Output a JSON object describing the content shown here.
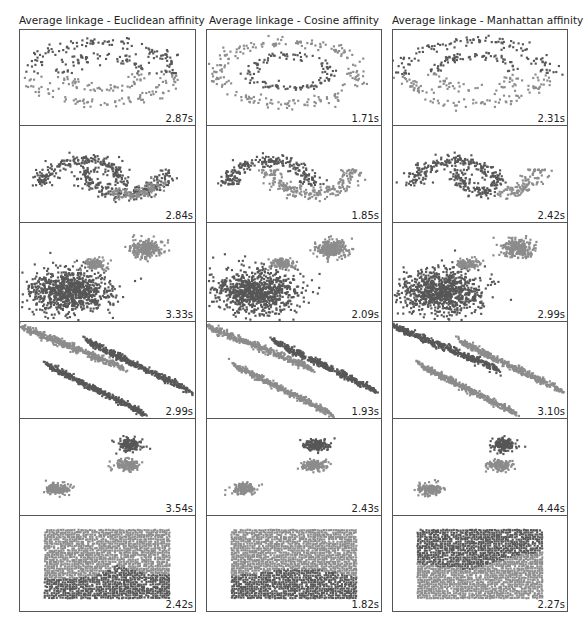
{
  "figure": {
    "background": "#ffffff",
    "cluster_colors": [
      "#575757",
      "#8c8c8c"
    ]
  },
  "columns": [
    {
      "title": "Average linkage - Euclidean affinity"
    },
    {
      "title": "Average linkage - Cosine affinity"
    },
    {
      "title": "Average linkage - Manhattan affinity"
    }
  ],
  "rows": [
    {
      "dataset": "noisy_circles"
    },
    {
      "dataset": "noisy_moons"
    },
    {
      "dataset": "varied"
    },
    {
      "dataset": "aniso"
    },
    {
      "dataset": "blobs"
    },
    {
      "dataset": "no_structure"
    }
  ],
  "chart_data": {
    "type": "scatter",
    "title": "",
    "layout": {
      "rows": 6,
      "cols": 3,
      "axes_visible": false,
      "grid": false
    },
    "col_titles": [
      "Average linkage - Euclidean affinity",
      "Average linkage - Cosine affinity",
      "Average linkage - Manhattan affinity"
    ],
    "row_datasets": [
      "noisy_circles",
      "noisy_moons",
      "varied",
      "aniso",
      "blobs",
      "no_structure"
    ],
    "timings": [
      [
        "2.87s",
        "1.71s",
        "2.31s"
      ],
      [
        "2.84s",
        "1.85s",
        "2.42s"
      ],
      [
        "3.33s",
        "2.09s",
        "2.99s"
      ],
      [
        "2.99s",
        "1.93s",
        "3.10s"
      ],
      [
        "3.54s",
        "2.43s",
        "4.44s"
      ],
      [
        "2.42s",
        "1.82s",
        "2.27s"
      ]
    ],
    "timings_seconds": [
      [
        2.87,
        1.71,
        2.31
      ],
      [
        2.84,
        1.85,
        2.42
      ],
      [
        3.33,
        2.09,
        2.99
      ],
      [
        2.99,
        1.93,
        3.1
      ],
      [
        3.54,
        2.43,
        4.44
      ],
      [
        2.42,
        1.82,
        2.27
      ]
    ],
    "panels": [
      [
        {
          "shapes": [
            {
              "kind": "ring",
              "cx": 0.47,
              "cy": 0.45,
              "rx": 0.41,
              "ry": 0.33,
              "w": 0.07,
              "color": 0,
              "split": "top"
            },
            {
              "kind": "ring",
              "cx": 0.47,
              "cy": 0.45,
              "rx": 0.41,
              "ry": 0.33,
              "w": 0.07,
              "color": 1,
              "split": "bottom"
            },
            {
              "kind": "ring",
              "cx": 0.47,
              "cy": 0.45,
              "rx": 0.23,
              "ry": 0.18,
              "w": 0.06,
              "color": 0,
              "split": "top"
            },
            {
              "kind": "ring",
              "cx": 0.47,
              "cy": 0.45,
              "rx": 0.23,
              "ry": 0.18,
              "w": 0.06,
              "color": 1,
              "split": "bottom"
            }
          ]
        },
        {
          "shapes": [
            {
              "kind": "ring",
              "cx": 0.47,
              "cy": 0.45,
              "rx": 0.41,
              "ry": 0.33,
              "w": 0.07,
              "color": 1,
              "split": "all"
            },
            {
              "kind": "ring",
              "cx": 0.47,
              "cy": 0.45,
              "rx": 0.23,
              "ry": 0.18,
              "w": 0.06,
              "color": 0,
              "split": "all"
            }
          ]
        },
        {
          "shapes": [
            {
              "kind": "ring",
              "cx": 0.47,
              "cy": 0.45,
              "rx": 0.41,
              "ry": 0.33,
              "w": 0.07,
              "color": 0,
              "split": "top"
            },
            {
              "kind": "ring",
              "cx": 0.47,
              "cy": 0.45,
              "rx": 0.41,
              "ry": 0.33,
              "w": 0.07,
              "color": 1,
              "split": "bottom"
            },
            {
              "kind": "ring",
              "cx": 0.47,
              "cy": 0.45,
              "rx": 0.23,
              "ry": 0.18,
              "w": 0.06,
              "color": 0,
              "split": "top"
            },
            {
              "kind": "ring",
              "cx": 0.47,
              "cy": 0.45,
              "rx": 0.23,
              "ry": 0.18,
              "w": 0.06,
              "color": 1,
              "split": "bottom"
            }
          ]
        }
      ],
      [
        {
          "shapes": [
            {
              "kind": "arc",
              "cx": 0.36,
              "cy": 0.62,
              "r": 0.24,
              "ry": 0.42,
              "a0": 180,
              "a1": 360,
              "w": 0.07,
              "color": 0
            },
            {
              "kind": "arc",
              "cx": 0.6,
              "cy": 0.45,
              "r": 0.24,
              "ry": 0.42,
              "a0": 0,
              "a1": 90,
              "w": 0.07,
              "color": 0
            },
            {
              "kind": "arc",
              "cx": 0.6,
              "cy": 0.45,
              "r": 0.24,
              "ry": 0.42,
              "a0": 90,
              "a1": 180,
              "w": 0.07,
              "color": 0
            },
            {
              "kind": "arc",
              "cx": 0.6,
              "cy": 0.45,
              "r": 0.24,
              "ry": 0.42,
              "a0": 25,
              "a1": 110,
              "w": 0.07,
              "color": 1
            }
          ]
        },
        {
          "shapes": [
            {
              "kind": "arc",
              "cx": 0.36,
              "cy": 0.62,
              "r": 0.24,
              "ry": 0.42,
              "a0": 180,
              "a1": 360,
              "w": 0.07,
              "color": 0
            },
            {
              "kind": "arc",
              "cx": 0.6,
              "cy": 0.45,
              "r": 0.24,
              "ry": 0.42,
              "a0": 0,
              "a1": 180,
              "w": 0.07,
              "color": 1
            }
          ]
        },
        {
          "shapes": [
            {
              "kind": "arc",
              "cx": 0.36,
              "cy": 0.62,
              "r": 0.24,
              "ry": 0.42,
              "a0": 180,
              "a1": 360,
              "w": 0.07,
              "color": 0
            },
            {
              "kind": "arc",
              "cx": 0.6,
              "cy": 0.45,
              "r": 0.24,
              "ry": 0.42,
              "a0": 90,
              "a1": 180,
              "w": 0.07,
              "color": 0
            },
            {
              "kind": "arc",
              "cx": 0.6,
              "cy": 0.45,
              "r": 0.24,
              "ry": 0.42,
              "a0": 0,
              "a1": 90,
              "w": 0.07,
              "color": 1
            }
          ]
        }
      ],
      [
        {
          "shapes": [
            {
              "kind": "blob",
              "cx": 0.28,
              "cy": 0.7,
              "rx": 0.24,
              "ry": 0.22,
              "n": 900,
              "color": 0,
              "loose": true
            },
            {
              "kind": "blob",
              "cx": 0.43,
              "cy": 0.42,
              "rx": 0.08,
              "ry": 0.06,
              "n": 120,
              "color": 1
            },
            {
              "kind": "blob",
              "cx": 0.72,
              "cy": 0.26,
              "rx": 0.1,
              "ry": 0.1,
              "n": 260,
              "color": 1
            }
          ]
        },
        {
          "shapes": [
            {
              "kind": "blob",
              "cx": 0.28,
              "cy": 0.7,
              "rx": 0.24,
              "ry": 0.22,
              "n": 900,
              "color": 0,
              "loose": true
            },
            {
              "kind": "blob",
              "cx": 0.43,
              "cy": 0.42,
              "rx": 0.08,
              "ry": 0.06,
              "n": 120,
              "color": 1
            },
            {
              "kind": "blob",
              "cx": 0.72,
              "cy": 0.26,
              "rx": 0.1,
              "ry": 0.1,
              "n": 260,
              "color": 1
            }
          ]
        },
        {
          "shapes": [
            {
              "kind": "blob",
              "cx": 0.28,
              "cy": 0.7,
              "rx": 0.24,
              "ry": 0.22,
              "n": 900,
              "color": 0,
              "loose": true
            },
            {
              "kind": "blob",
              "cx": 0.43,
              "cy": 0.42,
              "rx": 0.08,
              "ry": 0.06,
              "n": 120,
              "color": 1
            },
            {
              "kind": "blob",
              "cx": 0.72,
              "cy": 0.26,
              "rx": 0.1,
              "ry": 0.1,
              "n": 260,
              "color": 1
            }
          ]
        }
      ],
      [
        {
          "shapes": [
            {
              "kind": "band",
              "x0": 0.0,
              "y0": 0.05,
              "x1": 0.6,
              "y1": 0.48,
              "w": 0.07,
              "color": 1
            },
            {
              "kind": "band",
              "x0": 0.38,
              "y0": 0.2,
              "x1": 0.98,
              "y1": 0.72,
              "w": 0.07,
              "color": 0
            },
            {
              "kind": "band",
              "x0": 0.15,
              "y0": 0.45,
              "x1": 0.72,
              "y1": 0.96,
              "w": 0.07,
              "color": 0
            }
          ]
        },
        {
          "shapes": [
            {
              "kind": "band",
              "x0": 0.0,
              "y0": 0.05,
              "x1": 0.6,
              "y1": 0.48,
              "w": 0.07,
              "color": 1
            },
            {
              "kind": "band",
              "x0": 0.38,
              "y0": 0.2,
              "x1": 0.98,
              "y1": 0.72,
              "w": 0.07,
              "color": 0
            },
            {
              "kind": "band",
              "x0": 0.15,
              "y0": 0.45,
              "x1": 0.72,
              "y1": 0.96,
              "w": 0.07,
              "color": 1
            }
          ]
        },
        {
          "shapes": [
            {
              "kind": "band",
              "x0": 0.0,
              "y0": 0.05,
              "x1": 0.6,
              "y1": 0.48,
              "w": 0.07,
              "color": 0
            },
            {
              "kind": "band",
              "x0": 0.38,
              "y0": 0.2,
              "x1": 0.98,
              "y1": 0.72,
              "w": 0.07,
              "color": 1
            },
            {
              "kind": "band",
              "x0": 0.15,
              "y0": 0.45,
              "x1": 0.72,
              "y1": 0.96,
              "w": 0.07,
              "color": 1
            }
          ]
        }
      ],
      [
        {
          "shapes": [
            {
              "kind": "blob",
              "cx": 0.63,
              "cy": 0.27,
              "rx": 0.08,
              "ry": 0.07,
              "n": 160,
              "color": 0
            },
            {
              "kind": "blob",
              "cx": 0.62,
              "cy": 0.48,
              "rx": 0.08,
              "ry": 0.06,
              "n": 160,
              "color": 1
            },
            {
              "kind": "blob",
              "cx": 0.21,
              "cy": 0.73,
              "rx": 0.08,
              "ry": 0.06,
              "n": 160,
              "color": 1
            }
          ]
        },
        {
          "shapes": [
            {
              "kind": "blob",
              "cx": 0.63,
              "cy": 0.27,
              "rx": 0.08,
              "ry": 0.07,
              "n": 160,
              "color": 0
            },
            {
              "kind": "blob",
              "cx": 0.62,
              "cy": 0.48,
              "rx": 0.08,
              "ry": 0.06,
              "n": 160,
              "color": 1
            },
            {
              "kind": "blob",
              "cx": 0.21,
              "cy": 0.73,
              "rx": 0.08,
              "ry": 0.06,
              "n": 160,
              "color": 1
            }
          ]
        },
        {
          "shapes": [
            {
              "kind": "blob",
              "cx": 0.63,
              "cy": 0.27,
              "rx": 0.08,
              "ry": 0.07,
              "n": 160,
              "color": 0
            },
            {
              "kind": "blob",
              "cx": 0.62,
              "cy": 0.48,
              "rx": 0.08,
              "ry": 0.06,
              "n": 160,
              "color": 1
            },
            {
              "kind": "blob",
              "cx": 0.21,
              "cy": 0.73,
              "rx": 0.08,
              "ry": 0.06,
              "n": 160,
              "color": 1
            }
          ]
        }
      ],
      [
        {
          "shapes": [
            {
              "kind": "rect",
              "x0": 0.14,
              "y0": 0.15,
              "x1": 0.86,
              "y1": 0.88,
              "split": "wave",
              "top": 1,
              "bottom": 0,
              "boundary": [
                [
                  0.14,
                  0.66
                ],
                [
                  0.3,
                  0.66
                ],
                [
                  0.45,
                  0.62
                ],
                [
                  0.55,
                  0.52
                ],
                [
                  0.65,
                  0.57
                ],
                [
                  0.75,
                  0.62
                ],
                [
                  0.86,
                  0.62
                ]
              ]
            }
          ]
        },
        {
          "shapes": [
            {
              "kind": "rect",
              "x0": 0.14,
              "y0": 0.15,
              "x1": 0.86,
              "y1": 0.88,
              "split": "wave",
              "top": 1,
              "bottom": 0,
              "boundary": [
                [
                  0.14,
                  0.64
                ],
                [
                  0.3,
                  0.6
                ],
                [
                  0.45,
                  0.56
                ],
                [
                  0.6,
                  0.56
                ],
                [
                  0.75,
                  0.6
                ],
                [
                  0.86,
                  0.64
                ]
              ]
            }
          ]
        },
        {
          "shapes": [
            {
              "kind": "rect",
              "x0": 0.14,
              "y0": 0.15,
              "x1": 0.86,
              "y1": 0.88,
              "split": "wave",
              "top": 0,
              "bottom": 1,
              "boundary": [
                [
                  0.14,
                  0.5
                ],
                [
                  0.3,
                  0.54
                ],
                [
                  0.45,
                  0.56
                ],
                [
                  0.58,
                  0.5
                ],
                [
                  0.7,
                  0.42
                ],
                [
                  0.86,
                  0.38
                ]
              ]
            }
          ]
        }
      ]
    ]
  }
}
